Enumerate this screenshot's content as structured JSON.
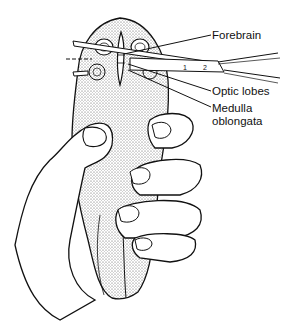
{
  "figure": {
    "labels": {
      "forebrain": "Forebrain",
      "optic_lobes": "Optic lobes",
      "medulla_line1": "Medulla",
      "medulla_line2": "oblongata"
    },
    "instrument_marks": [
      "1",
      "2"
    ],
    "colors": {
      "ink": "#111111",
      "stipple": "#9a9a9a",
      "background": "#ffffff"
    }
  }
}
